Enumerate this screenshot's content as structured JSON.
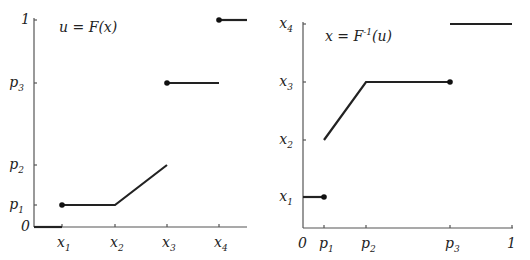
{
  "chart_data": [
    {
      "type": "line",
      "title": "u = F(x)",
      "title_parts": {
        "lhs": "u",
        "eq": " = ",
        "fn": "F",
        "arg": "(x)"
      },
      "x_ticks": [
        {
          "name": "x",
          "sub": "1",
          "value": 1
        },
        {
          "name": "x",
          "sub": "2",
          "value": 2
        },
        {
          "name": "x",
          "sub": "3",
          "value": 3
        },
        {
          "name": "x",
          "sub": "4",
          "value": 4
        }
      ],
      "y_ticks": [
        {
          "name": "0",
          "sub": "",
          "value": 0
        },
        {
          "name": "p",
          "sub": "1",
          "value": 0.12
        },
        {
          "name": "p",
          "sub": "2",
          "value": 0.3
        },
        {
          "name": "p",
          "sub": "3",
          "value": 0.7
        },
        {
          "name": "1",
          "sub": "",
          "value": 1
        }
      ],
      "xlim": [
        0.45,
        4.45
      ],
      "ylim": [
        0,
        1
      ],
      "segments": [
        {
          "points": [
            [
              0.45,
              0
            ],
            [
              1,
              0
            ]
          ]
        },
        {
          "points": [
            [
              1,
              0.12
            ],
            [
              2,
              0.12
            ],
            [
              3,
              0.3
            ]
          ]
        },
        {
          "points": [
            [
              3,
              0.7
            ],
            [
              4,
              0.7
            ]
          ]
        },
        {
          "points": [
            [
              4,
              1
            ],
            [
              4.5,
              1
            ]
          ]
        }
      ],
      "dots": [
        [
          1,
          0.12
        ],
        [
          3,
          0.7
        ],
        [
          4,
          1
        ]
      ]
    },
    {
      "type": "line",
      "title": "x = F^-1(u)",
      "title_parts": {
        "lhs": "x",
        "eq": " = ",
        "fn": "F",
        "sup": "-1",
        "arg": "(u)"
      },
      "x_ticks": [
        {
          "name": "0",
          "sub": "",
          "value": 0
        },
        {
          "name": "p",
          "sub": "1",
          "value": 0.1
        },
        {
          "name": "p",
          "sub": "2",
          "value": 0.3
        },
        {
          "name": "p",
          "sub": "3",
          "value": 0.7
        },
        {
          "name": "1",
          "sub": "",
          "value": 1
        }
      ],
      "y_ticks": [
        {
          "name": "x",
          "sub": "1",
          "value": 1
        },
        {
          "name": "x",
          "sub": "2",
          "value": 2
        },
        {
          "name": "x",
          "sub": "3",
          "value": 3
        },
        {
          "name": "x",
          "sub": "4",
          "value": 4
        }
      ],
      "xlim": [
        0,
        1
      ],
      "ylim": [
        0.45,
        4.45
      ],
      "segments": [
        {
          "points": [
            [
              0,
              1
            ],
            [
              0.1,
              1
            ]
          ]
        },
        {
          "points": [
            [
              0.1,
              2
            ],
            [
              0.3,
              3
            ],
            [
              0.7,
              3
            ]
          ]
        },
        {
          "points": [
            [
              0.7,
              4
            ],
            [
              1,
              4
            ]
          ]
        }
      ],
      "dots": [
        [
          0.1,
          1
        ],
        [
          0.7,
          3
        ]
      ]
    }
  ]
}
